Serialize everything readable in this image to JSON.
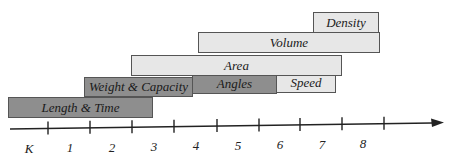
{
  "diagram": {
    "type": "grade-band progression timeline",
    "colors": {
      "dark_fill": "#8e8e8e",
      "light_fill": "#e7e7e7",
      "border": "#555555",
      "axis": "#222222"
    },
    "bars": [
      {
        "label": "Length & Time",
        "shade": "dark",
        "x": 8,
        "y": 97,
        "w": 145,
        "h": 21
      },
      {
        "label": "Weight & Capacity",
        "shade": "dark",
        "x": 84,
        "y": 77,
        "w": 109,
        "h": 20
      },
      {
        "label": "Angles",
        "shade": "dark",
        "x": 192,
        "y": 74,
        "w": 85,
        "h": 20
      },
      {
        "label": "Speed",
        "shade": "light",
        "x": 276,
        "y": 73,
        "w": 60,
        "h": 20
      },
      {
        "label": "Area",
        "shade": "light",
        "x": 131,
        "y": 55,
        "w": 211,
        "h": 21
      },
      {
        "label": "Volume",
        "shade": "light",
        "x": 198,
        "y": 32,
        "w": 182,
        "h": 21
      },
      {
        "label": "Density",
        "shade": "light",
        "x": 313,
        "y": 12,
        "w": 66,
        "h": 21
      }
    ],
    "axis": {
      "labels": [
        "K",
        "1",
        "2",
        "3",
        "4",
        "5",
        "6",
        "7",
        "8"
      ],
      "label_x": [
        29,
        70,
        112,
        154,
        196,
        238,
        280,
        322,
        363
      ],
      "tick_x": [
        48,
        90,
        132,
        174,
        217,
        259,
        300,
        342,
        384
      ]
    }
  }
}
